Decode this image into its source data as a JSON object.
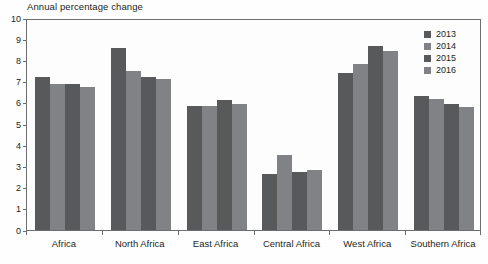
{
  "chart_data": {
    "type": "bar",
    "title": "Annual percentage change",
    "xlabel": "",
    "ylabel": "",
    "ylim": [
      0,
      10
    ],
    "yticks": [
      0,
      1,
      2,
      3,
      4,
      5,
      6,
      7,
      8,
      9,
      10
    ],
    "grid": false,
    "legend_position": "top-right",
    "categories": [
      "Africa",
      "North Africa",
      "East Africa",
      "Central Africa",
      "West Africa",
      "Southern Africa"
    ],
    "series": [
      {
        "name": "2013",
        "color": "#58595b",
        "values": [
          7.2,
          8.6,
          5.85,
          2.65,
          7.4,
          6.3
        ]
      },
      {
        "name": "2014",
        "color": "#808285",
        "values": [
          6.9,
          7.5,
          5.85,
          3.55,
          7.85,
          6.2
        ]
      },
      {
        "name": "2015",
        "color": "#58595b",
        "values": [
          6.9,
          7.2,
          6.15,
          2.75,
          8.7,
          5.95
        ]
      },
      {
        "name": "2016",
        "color": "#808285",
        "values": [
          6.75,
          7.1,
          5.95,
          2.85,
          8.45,
          5.8
        ]
      }
    ]
  },
  "colors": {
    "dark_gray": "#58595b",
    "light_gray": "#808285",
    "axis": "#6d6e71",
    "text": "#231f20",
    "background": "#fefefe"
  }
}
